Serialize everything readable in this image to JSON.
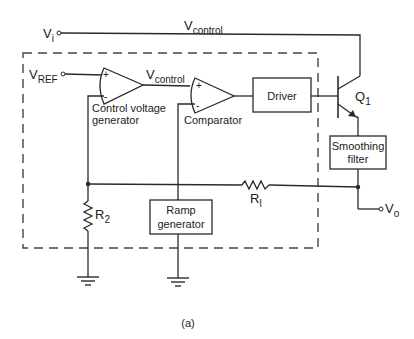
{
  "diagram": {
    "type": "circuit-schematic",
    "caption": "(a)",
    "terminals": {
      "vi": {
        "main": "V",
        "sub": "i"
      },
      "vref": {
        "main": "V",
        "sub": "REF"
      },
      "vo": {
        "main": "V",
        "sub": "o"
      }
    },
    "signals": {
      "vcontrol_top": {
        "main": "V",
        "sub": "control"
      },
      "vcontrol_mid": {
        "main": "V",
        "sub": "control"
      }
    },
    "opamps": [
      {
        "id": "control-voltage-generator",
        "label_line1": "Control voltage",
        "label_line2": "generator",
        "plus": "+",
        "minus": "-"
      },
      {
        "id": "comparator",
        "label": "Comparator",
        "plus": "+",
        "minus": "-"
      }
    ],
    "blocks": {
      "driver": "Driver",
      "smoothing_line1": "Smoothing",
      "smoothing_line2": "filter",
      "ramp_line1": "Ramp",
      "ramp_line2": "generator"
    },
    "transistor": {
      "main": "Q",
      "sub": "1"
    },
    "resistors": {
      "r1": {
        "main": "R",
        "sub": "l"
      },
      "r2": {
        "main": "R",
        "sub": "2"
      }
    }
  }
}
